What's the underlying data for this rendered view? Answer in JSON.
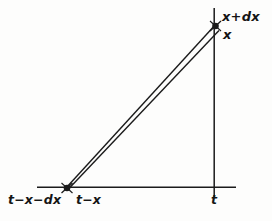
{
  "figure": {
    "kind": "geometry-diagram",
    "background_color": "#fdfdfc",
    "ink_color": "#151515",
    "labels": {
      "apex_upper": "x+dx",
      "apex_lower": "x",
      "base_left": "t−x−dx",
      "base_right": "t−x",
      "axis_foot": "t"
    },
    "geometry": {
      "horizontal_axis": {
        "x1": 37,
        "y1": 187,
        "x2": 236,
        "y2": 187
      },
      "vertical_axis": {
        "x1": 214,
        "y1": 8,
        "x2": 214,
        "y2": 197
      },
      "wedge_ray_upper": {
        "x1": 66,
        "y1": 188,
        "x2": 216,
        "y2": 24
      },
      "wedge_ray_lower": {
        "x1": 68,
        "y1": 189,
        "x2": 218,
        "y2": 30
      },
      "vertex_base": {
        "x": 67,
        "y": 188
      },
      "vertex_apex": {
        "x": 216,
        "y": 27
      }
    }
  }
}
